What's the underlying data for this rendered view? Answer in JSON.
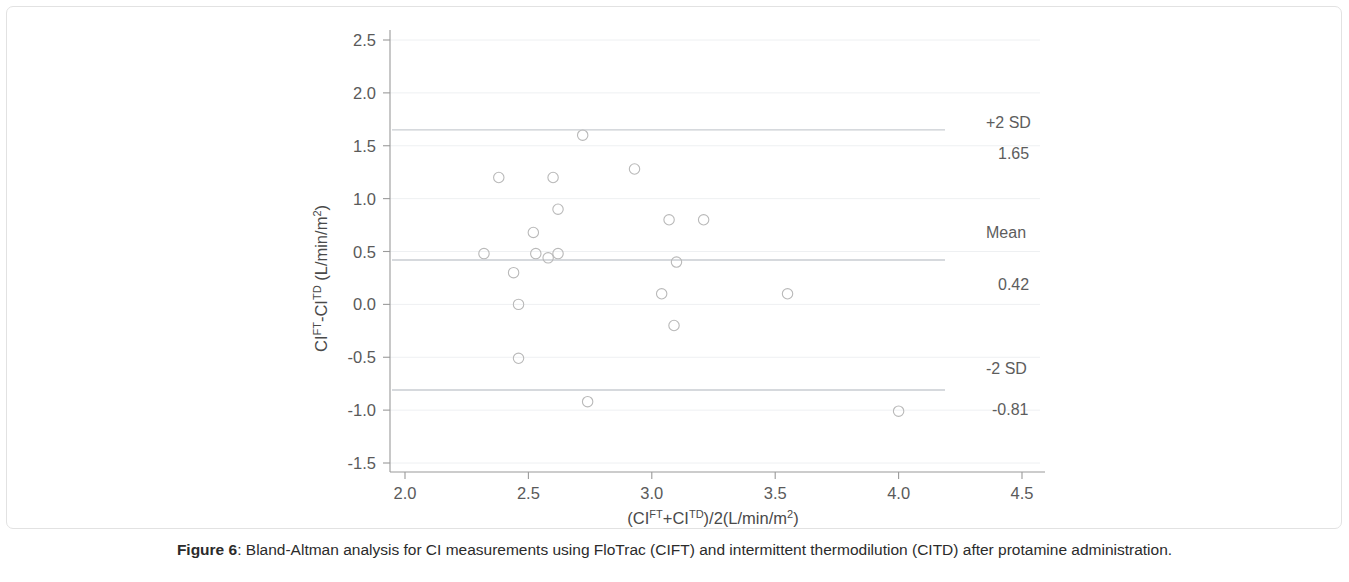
{
  "figure": {
    "caption_label": "Figure 6",
    "caption_separator": ": ",
    "caption_text": "Bland-Altman analysis for CI measurements using FloTrac (CIFT) and intermittent thermodilution (CITD) after protamine administration."
  },
  "colors": {
    "background": "#ffffff",
    "border": "#e2e2e2",
    "axis": "#9a9a9a",
    "gridline": "#eef0f2",
    "sd_line": "#c9cdd2",
    "marker_stroke": "#b9b9b9",
    "tick_text": "#5a5a5a",
    "caption_text": "#2b2b2b"
  },
  "chart_data": {
    "type": "scatter",
    "title": "",
    "subtitle": "",
    "xlabel": "(CI^FT+CI^TD)/2(L/min/m2)",
    "ylabel": "CI^FT-CI^TD (L/min/m2)",
    "xlabel_parts": {
      "p1": "(CI",
      "sup1": "FT",
      "p2": "+CI",
      "sup2": "TD",
      "p3": ")/2(L/min/m",
      "sup3": "2",
      "p4": ")"
    },
    "ylabel_parts": {
      "p1": "CI",
      "sup1": "FT",
      "p2": "-CI",
      "sup2": "TD",
      "p3": " (L/min/m",
      "sup3": "2",
      "p4": ")"
    },
    "xlim": [
      2.0,
      4.5
    ],
    "ylim": [
      -1.5,
      2.5
    ],
    "xticks": [
      2.0,
      2.5,
      3.0,
      3.5,
      4.0,
      4.5
    ],
    "xtick_labels": [
      "2.0",
      "2.5",
      "3.0",
      "3.5",
      "4.0",
      "4.5"
    ],
    "yticks": [
      -1.5,
      -1.0,
      -0.5,
      0.0,
      0.5,
      1.0,
      1.5,
      2.0,
      2.5
    ],
    "ytick_labels": [
      "-1.5",
      "-1.0",
      "-0.5",
      "0.0",
      "0.5",
      "1.0",
      "1.5",
      "2.0",
      "2.5"
    ],
    "grid": true,
    "grid_axis": "y",
    "legend": "none",
    "marker": "open-circle",
    "points": [
      {
        "x": 2.32,
        "y": 0.48
      },
      {
        "x": 2.38,
        "y": 1.2
      },
      {
        "x": 2.44,
        "y": 0.3
      },
      {
        "x": 2.46,
        "y": 0.0
      },
      {
        "x": 2.46,
        "y": -0.51
      },
      {
        "x": 2.52,
        "y": 0.68
      },
      {
        "x": 2.53,
        "y": 0.48
      },
      {
        "x": 2.58,
        "y": 0.44
      },
      {
        "x": 2.6,
        "y": 1.2
      },
      {
        "x": 2.62,
        "y": 0.48
      },
      {
        "x": 2.62,
        "y": 0.9
      },
      {
        "x": 2.72,
        "y": 1.6
      },
      {
        "x": 2.74,
        "y": -0.92
      },
      {
        "x": 2.93,
        "y": 1.28
      },
      {
        "x": 3.04,
        "y": 0.1
      },
      {
        "x": 3.07,
        "y": 0.8
      },
      {
        "x": 3.09,
        "y": -0.2
      },
      {
        "x": 3.1,
        "y": 0.4
      },
      {
        "x": 3.21,
        "y": 0.8
      },
      {
        "x": 3.55,
        "y": 0.1
      },
      {
        "x": 4.0,
        "y": -1.01
      }
    ],
    "reference_lines": [
      {
        "id": "upper-sd",
        "label": "+2 SD",
        "value_label": "1.65",
        "value": 1.65
      },
      {
        "id": "mean",
        "label": "Mean",
        "value_label": "0.42",
        "value": 0.42
      },
      {
        "id": "lower-sd",
        "label": "-2 SD",
        "value_label": "-0.81",
        "value": -0.81
      }
    ]
  }
}
